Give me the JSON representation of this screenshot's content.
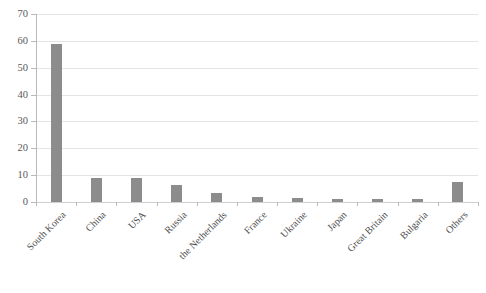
{
  "chart_data": {
    "type": "bar",
    "title": "",
    "xlabel": "",
    "ylabel": "",
    "ylim": [
      0,
      70
    ],
    "yticks": [
      "0",
      "10",
      "20",
      "30",
      "40",
      "50",
      "60",
      "70"
    ],
    "grid": true,
    "legend": false,
    "orientation": "vertical",
    "series_color": "#8c8c8c",
    "categories": [
      "South Korea",
      "China",
      "USA",
      "Russia",
      "the Netherlands",
      "France",
      "Ukraine",
      "Japan",
      "Great Britain",
      "Bulgaria",
      "Others"
    ],
    "values": [
      59,
      9,
      9,
      6.5,
      3.5,
      1.8,
      1.5,
      1.2,
      1.1,
      1,
      7.5
    ],
    "series": [
      {
        "name": "Series 1",
        "color": "#8c8c8c",
        "values": [
          59,
          9,
          9,
          6.5,
          3.5,
          1.8,
          1.5,
          1.2,
          1.1,
          1,
          7.5
        ]
      }
    ]
  },
  "colors": {
    "bar": "#8c8c8c",
    "gridline": "#e4e4e4",
    "axis": "#b9b9b9",
    "text": "#555555",
    "background": "#ffffff"
  }
}
